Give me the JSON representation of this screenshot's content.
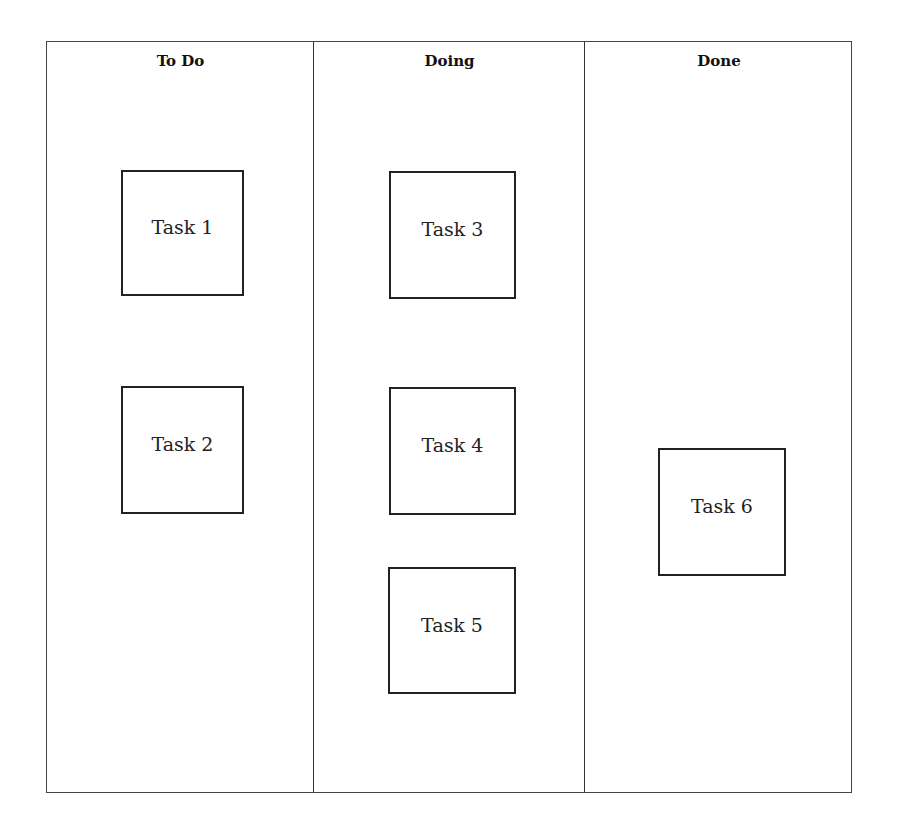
{
  "board": {
    "columns": [
      {
        "title": "To Do",
        "cards": [
          {
            "label": "Task 1"
          },
          {
            "label": "Task 2"
          }
        ]
      },
      {
        "title": "Doing",
        "cards": [
          {
            "label": "Task 3"
          },
          {
            "label": "Task 4"
          },
          {
            "label": "Task 5"
          }
        ]
      },
      {
        "title": "Done",
        "cards": [
          {
            "label": "Task 6"
          }
        ]
      }
    ]
  }
}
